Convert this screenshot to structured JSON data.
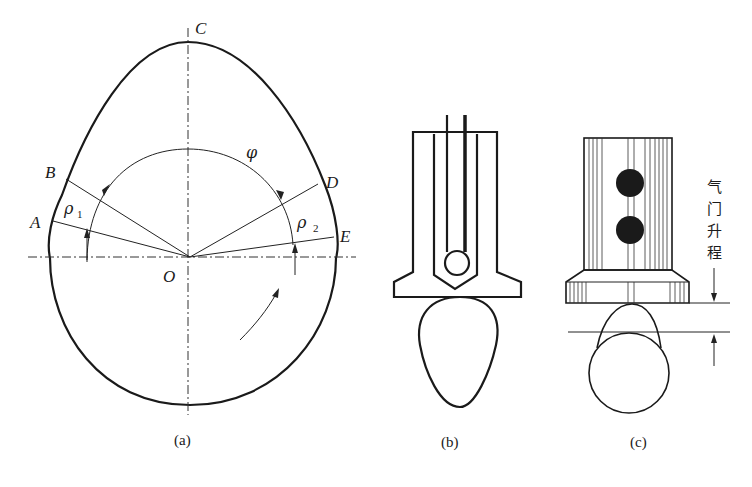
{
  "figure": {
    "panels": [
      {
        "id": "a",
        "caption": "(a)"
      },
      {
        "id": "b",
        "caption": "(b)"
      },
      {
        "id": "c",
        "caption": "(c)"
      }
    ],
    "panel_a": {
      "points": {
        "A": "A",
        "B": "B",
        "C": "C",
        "D": "D",
        "E": "E",
        "O": "O"
      },
      "angle_label": "φ",
      "radius_labels": [
        {
          "symbol": "ρ",
          "subscript": "1"
        },
        {
          "symbol": "ρ",
          "subscript": "2"
        }
      ]
    },
    "panel_c": {
      "dimension_label_chars": [
        "气",
        "门",
        "升",
        "程"
      ]
    }
  }
}
